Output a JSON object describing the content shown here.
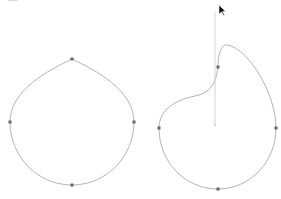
{
  "header": {
    "text": "—"
  },
  "canvas": {
    "stroke": "#9a9a9a",
    "handle_stroke": "#bdbdbd",
    "node_fill": "#555555",
    "shapes": [
      {
        "name": "left-shape",
        "nodes": [
          [
            72,
            59
          ],
          [
            134,
            122
          ],
          [
            72,
            185
          ],
          [
            10,
            122
          ]
        ]
      },
      {
        "name": "right-shape",
        "nodes": [
          [
            218,
            67
          ],
          [
            276,
            128
          ],
          [
            218,
            189
          ],
          [
            159,
            128
          ]
        ],
        "selected_node": [
          218,
          67
        ],
        "handle_end": [
          215,
          125
        ],
        "handle_top": [
          215,
          12
        ]
      }
    ]
  },
  "cursor": {
    "icon": "arrow-cursor",
    "x": 220,
    "y": 8
  }
}
